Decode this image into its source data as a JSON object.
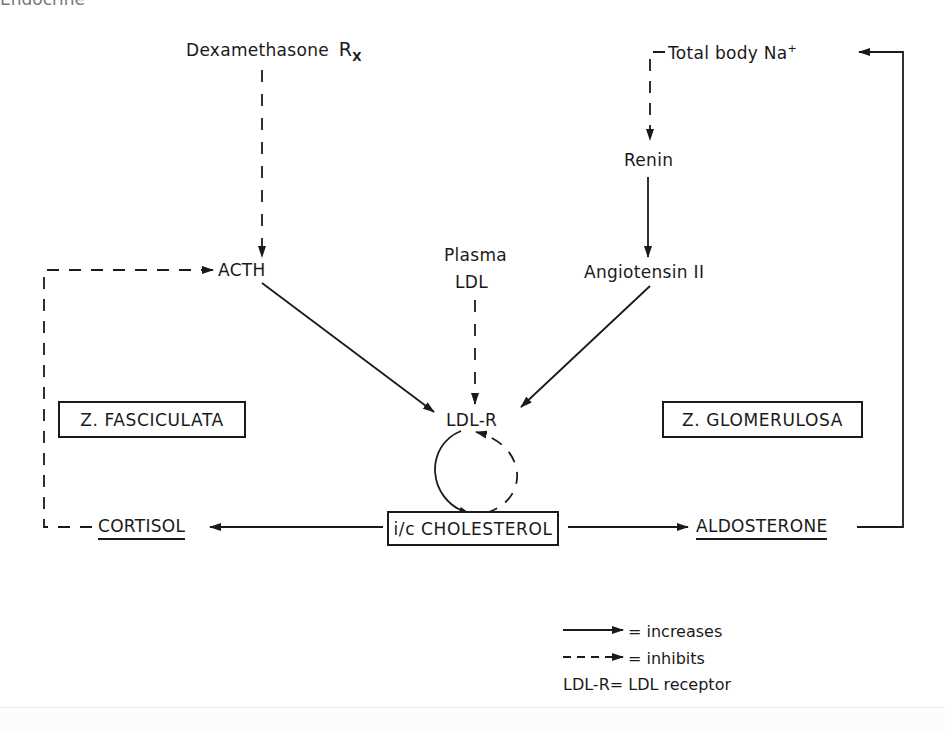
{
  "header": {
    "partial_title": "Endocrine"
  },
  "nodes": {
    "dexamethasone": {
      "label": "Dexamethasone",
      "suffix": "R",
      "suffix_sub": "X"
    },
    "acth": {
      "label": "ACTH"
    },
    "plasma_ldl": {
      "line1": "Plasma",
      "line2": "LDL"
    },
    "total_body_na": {
      "label": "Total body Na",
      "superscript": "+"
    },
    "renin": {
      "label": "Renin"
    },
    "angiotensin": {
      "label": "Angiotensin II"
    },
    "ldl_r": {
      "label": "LDL-R"
    },
    "z_fasciculata": {
      "label": "Z. FASCICULATA"
    },
    "z_glomerulosa": {
      "label": "Z. GLOMERULOSA"
    },
    "cholesterol": {
      "label": "i/c CHOLESTEROL"
    },
    "cortisol": {
      "label": "CORTISOL"
    },
    "aldosterone": {
      "label": "ALDOSTERONE"
    }
  },
  "edges": [
    {
      "from": "Dexamethasone Rx",
      "to": "ACTH",
      "style": "dashed"
    },
    {
      "from": "CORTISOL",
      "to": "ACTH",
      "style": "dashed"
    },
    {
      "from": "ACTH",
      "to": "LDL-R",
      "style": "solid"
    },
    {
      "from": "Plasma LDL",
      "to": "LDL-R",
      "style": "dashed"
    },
    {
      "from": "Angiotensin II",
      "to": "LDL-R",
      "style": "solid"
    },
    {
      "from": "Total body Na+",
      "to": "Renin",
      "style": "dashed"
    },
    {
      "from": "Renin",
      "to": "Angiotensin II",
      "style": "solid"
    },
    {
      "from": "LDL-R",
      "to": "i/c CHOLESTEROL",
      "style": "solid"
    },
    {
      "from": "i/c CHOLESTEROL",
      "to": "LDL-R",
      "style": "dashed"
    },
    {
      "from": "i/c CHOLESTEROL",
      "to": "CORTISOL",
      "style": "solid"
    },
    {
      "from": "i/c CHOLESTEROL",
      "to": "ALDOSTERONE",
      "style": "solid"
    },
    {
      "from": "ALDOSTERONE",
      "to": "Total body Na+",
      "style": "solid"
    }
  ],
  "legend": {
    "solid": "= increases",
    "dashed": "= inhibits",
    "abbrev": "LDL-R= LDL receptor"
  },
  "colors": {
    "ink": "#1a1a1a",
    "background": "#ffffff"
  }
}
